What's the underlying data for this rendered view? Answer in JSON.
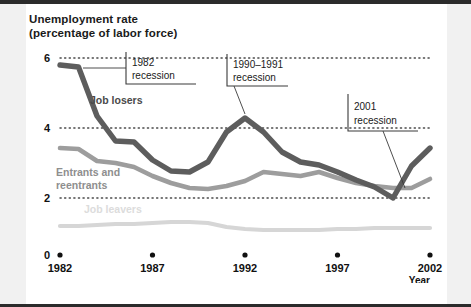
{
  "chart_data": {
    "type": "line",
    "xlabel": "Year",
    "ylabel": "Unemployment rate (percentage of labor force)",
    "xlim": [
      1982,
      2002
    ],
    "ylim": [
      0,
      6
    ],
    "grid": "horizontal-dotted",
    "legend": "inline-labels",
    "xticks": [
      1982,
      1987,
      1992,
      1997,
      2002
    ],
    "xtick_labels": [
      "1982",
      "1987",
      "1992",
      "1997",
      "2002"
    ],
    "yticks": [
      0,
      2,
      4,
      6
    ],
    "ytick_labels": [
      "0",
      "2",
      "4",
      "6"
    ],
    "x": [
      1982,
      1983,
      1984,
      1985,
      1986,
      1987,
      1988,
      1989,
      1990,
      1991,
      1992,
      1993,
      1994,
      1995,
      1996,
      1997,
      1998,
      1999,
      2000,
      2001,
      2002
    ],
    "series": [
      {
        "name": "Job losers",
        "color": "#5a5a5a",
        "values": [
          5.8,
          5.75,
          4.05,
          3.35,
          3.3,
          2.8,
          2.5,
          2.45,
          2.75,
          3.6,
          4.3,
          3.85,
          3.25,
          2.95,
          2.85,
          2.65,
          2.4,
          2.2,
          1.95,
          2.85,
          3.35
        ]
      },
      {
        "name": "Entrants and reentrants",
        "color": "#9a9a9a",
        "values": [
          3.15,
          3.1,
          2.75,
          2.7,
          2.6,
          2.35,
          2.15,
          2.0,
          1.95,
          2.05,
          2.2,
          2.45,
          2.4,
          2.35,
          2.45,
          2.3,
          2.2,
          2.1,
          2.0,
          2.0,
          2.25
        ]
      },
      {
        "name": "Job leavers",
        "color": "#d4d4d4",
        "values": [
          0.78,
          0.8,
          0.82,
          0.85,
          0.85,
          0.88,
          0.92,
          0.92,
          0.88,
          0.76,
          0.7,
          0.68,
          0.68,
          0.68,
          0.68,
          0.7,
          0.7,
          0.72,
          0.74,
          0.74,
          0.74
        ]
      }
    ],
    "annotations": [
      {
        "id": "recession-1982",
        "label": "1982\nrecession",
        "points_to_year": 1983,
        "points_to_value": 5.75
      },
      {
        "id": "recession-1990-1991",
        "label": "1990–1991\nrecession",
        "points_to_year": 1992,
        "points_to_value": 4.3
      },
      {
        "id": "recession-2001",
        "label": "2001\nrecession",
        "points_to_year": 2001,
        "points_to_value": 2.1
      }
    ]
  },
  "series_labels": {
    "job_losers": "Job losers",
    "entrants": "Entrants and\nreentrants",
    "job_leavers": "Job leavers"
  },
  "callouts": {
    "c1982_line1": "1982",
    "c1982_line2": "recession",
    "c1990_line1": "1990–1991",
    "c1990_line2": "recession",
    "c2001_line1": "2001",
    "c2001_line2": "recession"
  },
  "axes": {
    "y_ticks": [
      "6",
      "4",
      "2",
      "0"
    ],
    "x_ticks": [
      "1982",
      "1987",
      "1992",
      "1997",
      "2002"
    ],
    "x_caption": "Year"
  }
}
